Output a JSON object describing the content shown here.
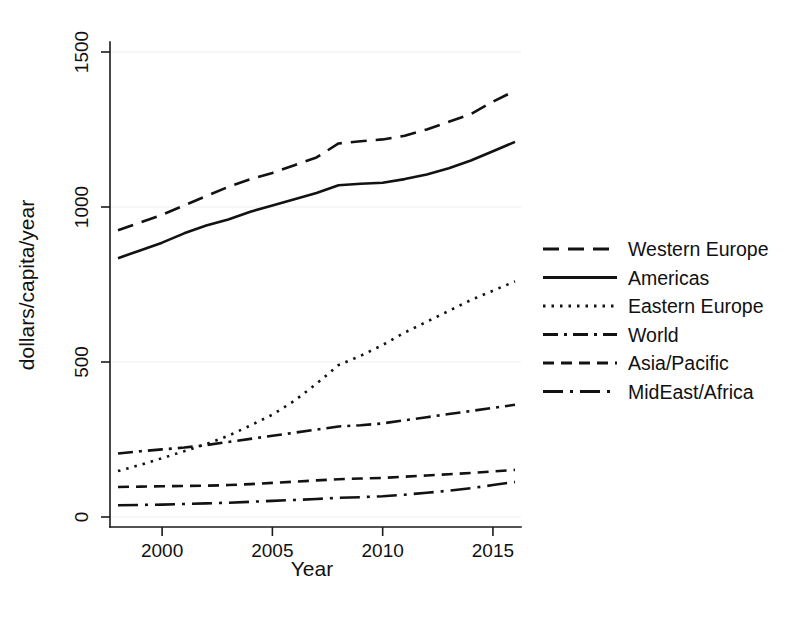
{
  "chart_data": {
    "type": "line",
    "title": "",
    "xlabel": "Year",
    "ylabel": "dollars/capita/year",
    "xlim": [
      1998,
      2016
    ],
    "ylim": [
      0,
      1560
    ],
    "grid": true,
    "legend_position": "right",
    "x_ticks": [
      2000,
      2005,
      2010,
      2015
    ],
    "x_tick_labels": [
      "2000",
      "2005",
      "2010",
      "2015"
    ],
    "y_ticks": [
      0,
      500,
      1000,
      1500
    ],
    "y_tick_labels": [
      "0",
      "500",
      "1000",
      "1500"
    ],
    "x": [
      1998,
      1999,
      2000,
      2001,
      2002,
      2003,
      2004,
      2005,
      2006,
      2007,
      2008,
      2009,
      2010,
      2011,
      2012,
      2013,
      2014,
      2015,
      2016
    ],
    "series": [
      {
        "name": "Western Europe",
        "style": "long-dash",
        "dasharray": "16,9",
        "values": [
          925,
          950,
          975,
          1005,
          1035,
          1065,
          1090,
          1110,
          1135,
          1160,
          1205,
          1212,
          1218,
          1230,
          1250,
          1275,
          1300,
          1340,
          1375
        ]
      },
      {
        "name": "Americas",
        "style": "solid",
        "dasharray": "none",
        "values": [
          835,
          860,
          885,
          915,
          940,
          960,
          985,
          1005,
          1025,
          1045,
          1070,
          1075,
          1078,
          1090,
          1105,
          1125,
          1150,
          1180,
          1210
        ]
      },
      {
        "name": "Eastern Europe",
        "style": "dotted",
        "dasharray": "2.5,6",
        "values": [
          148,
          168,
          190,
          212,
          235,
          262,
          295,
          330,
          375,
          430,
          490,
          520,
          555,
          595,
          630,
          665,
          700,
          730,
          760
        ]
      },
      {
        "name": "World",
        "style": "dash-dot",
        "dasharray": "15,6,3,6",
        "values": [
          205,
          212,
          218,
          224,
          232,
          242,
          252,
          262,
          272,
          282,
          292,
          296,
          302,
          312,
          322,
          332,
          342,
          352,
          362
        ]
      },
      {
        "name": "Asia/Pacific",
        "style": "medium-dash",
        "dasharray": "11,7",
        "values": [
          97,
          98,
          99,
          100,
          101,
          103,
          106,
          110,
          114,
          118,
          122,
          124,
          126,
          130,
          134,
          138,
          142,
          147,
          152
        ]
      },
      {
        "name": "MidEast/Africa",
        "style": "long-dash-dot",
        "dasharray": "20,7,3,7",
        "values": [
          38,
          39,
          40,
          42,
          44,
          46,
          49,
          52,
          55,
          58,
          62,
          64,
          67,
          72,
          78,
          85,
          93,
          103,
          113
        ]
      }
    ]
  },
  "legend": {
    "items": [
      {
        "label": "Western Europe"
      },
      {
        "label": "Americas"
      },
      {
        "label": "Eastern Europe"
      },
      {
        "label": "World"
      },
      {
        "label": "Asia/Pacific"
      },
      {
        "label": "MidEast/Africa"
      }
    ]
  }
}
